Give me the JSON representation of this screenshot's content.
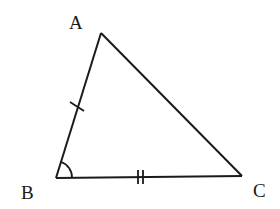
{
  "diagram": {
    "type": "triangle",
    "vertices": {
      "A": {
        "label": "A",
        "x": 101,
        "y": 33
      },
      "B": {
        "label": "B",
        "x": 56,
        "y": 178
      },
      "C": {
        "label": "C",
        "x": 242,
        "y": 176
      }
    },
    "markings": {
      "AB": "single tick (equal length)",
      "BC": "double tick (equal length)",
      "angle_B": "single arc"
    },
    "colors": {
      "stroke": "#1a1a1a",
      "background": "#ffffff"
    }
  }
}
